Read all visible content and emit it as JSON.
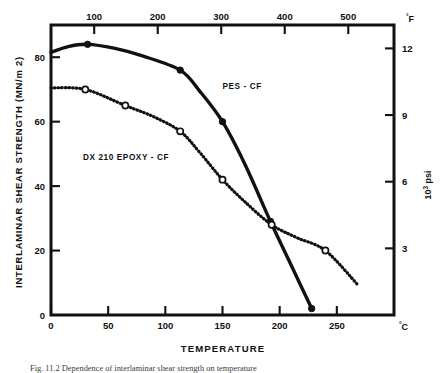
{
  "figure": {
    "caption": "Fig. 11.2  Dependence of interlaminar shear strength on temperature"
  },
  "chart_data": {
    "type": "line",
    "title": "",
    "xlabel": "TEMPERATURE",
    "ylabel": "INTERLAMINAR SHEAR STRENGTH (MN/m 2)",
    "x_unit_label": "°C",
    "x_unit_label_secondary": "°F",
    "y_unit_label_secondary_prefix": "10",
    "y_unit_label_secondary_sup": "3",
    "y_unit_label_secondary_suffix": " psi",
    "xlim": [
      0,
      300
    ],
    "ylim": [
      0,
      90
    ],
    "x_ticks": [
      0,
      50,
      100,
      150,
      200,
      250
    ],
    "x_tick_labels": [
      "0",
      "50",
      "100",
      "150",
      "200",
      "250"
    ],
    "x_ticks_top_f": [
      100,
      200,
      300,
      400,
      500
    ],
    "x_tick_labels_top": [
      "100",
      "200",
      "300",
      "400",
      "500"
    ],
    "y_ticks": [
      0,
      20,
      40,
      60,
      80
    ],
    "y_tick_labels": [
      "0",
      "20",
      "40",
      "60",
      "80"
    ],
    "y_ticks_right_ksi": [
      3,
      6,
      9,
      12
    ],
    "y_tick_labels_right": [
      "3",
      "6",
      "9",
      "12"
    ],
    "grid": false,
    "legend": "inline-annotations",
    "series": [
      {
        "name": "PES - CF",
        "label": "PES - CF",
        "style": "solid",
        "marker": "filled-circle",
        "label_x": 150,
        "label_y": 70,
        "points": [
          {
            "x": 32,
            "y": 84
          },
          {
            "x": 113,
            "y": 76
          },
          {
            "x": 150,
            "y": 60
          },
          {
            "x": 192,
            "y": 29
          },
          {
            "x": 228,
            "y": 2
          }
        ],
        "curve": [
          {
            "x": 0,
            "y": 81.5
          },
          {
            "x": 15,
            "y": 83.3
          },
          {
            "x": 32,
            "y": 84.0
          },
          {
            "x": 55,
            "y": 82.8
          },
          {
            "x": 80,
            "y": 80.4
          },
          {
            "x": 113,
            "y": 76.0
          },
          {
            "x": 130,
            "y": 69.5
          },
          {
            "x": 150,
            "y": 60.0
          },
          {
            "x": 170,
            "y": 46.5
          },
          {
            "x": 192,
            "y": 29.0
          },
          {
            "x": 210,
            "y": 15.5
          },
          {
            "x": 228,
            "y": 2.0
          }
        ]
      },
      {
        "name": "DX 210 EPOXY - CF",
        "label": "DX 210 EPOXY - CF",
        "style": "dotted",
        "marker": "open-circle",
        "label_x": 28,
        "label_y": 48,
        "points": [
          {
            "x": 30,
            "y": 70
          },
          {
            "x": 65,
            "y": 65
          },
          {
            "x": 113,
            "y": 57
          },
          {
            "x": 150,
            "y": 42
          },
          {
            "x": 193,
            "y": 28
          },
          {
            "x": 240,
            "y": 20
          }
        ],
        "curve": [
          {
            "x": 0,
            "y": 70.5
          },
          {
            "x": 30,
            "y": 70.0
          },
          {
            "x": 65,
            "y": 65.0
          },
          {
            "x": 90,
            "y": 61.5
          },
          {
            "x": 113,
            "y": 57.0
          },
          {
            "x": 130,
            "y": 50.5
          },
          {
            "x": 150,
            "y": 42.0
          },
          {
            "x": 170,
            "y": 35.0
          },
          {
            "x": 193,
            "y": 28.0
          },
          {
            "x": 215,
            "y": 24.0
          },
          {
            "x": 240,
            "y": 20.0
          },
          {
            "x": 268,
            "y": 9.5
          }
        ]
      }
    ]
  }
}
